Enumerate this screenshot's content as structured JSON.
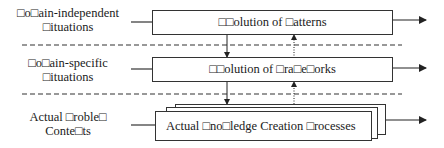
{
  "diagram": {
    "levels": [
      {
        "row_label": [
          "□o□ain-independent",
          "□ituations"
        ],
        "box_label": "□□olution of □atterns",
        "stacked": false
      },
      {
        "row_label": [
          "□o□ain-specific",
          "□ituations"
        ],
        "box_label": "□□olution of □ra□e□orks",
        "stacked": false
      },
      {
        "row_label": [
          "Actual □roble□",
          "Conte□ts"
        ],
        "box_label": "Actual □no□ledge Creation □rocesses",
        "stacked": true
      }
    ],
    "separators": [
      "dashed",
      "dashed"
    ],
    "connectors": {
      "downward": "solid arrow",
      "upward": "dotted arrow",
      "outgoing": "solid right arrow per level"
    },
    "colors": {
      "line": "#333333",
      "background": "#ffffff",
      "text": "#1a1a1a"
    }
  }
}
